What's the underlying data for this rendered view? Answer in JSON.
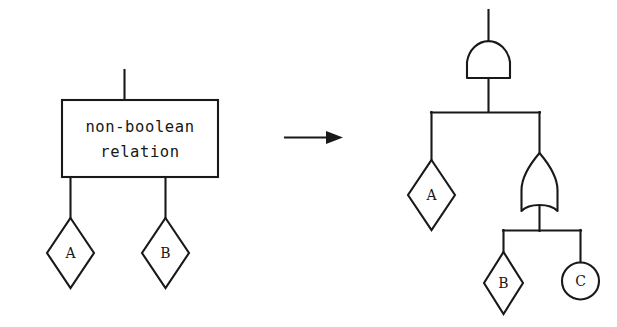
{
  "figure": {
    "kind": "logic-gate-transformation",
    "background_color": "#ffffff",
    "line_color": "#191919"
  },
  "left_side": {
    "block": {
      "line1": "non-boolean",
      "line2": "relation"
    },
    "top_wire": true,
    "children": [
      {
        "id": "A",
        "label": "A",
        "shape": "diamond"
      },
      {
        "id": "B",
        "label": "B",
        "shape": "diamond"
      }
    ]
  },
  "transform_arrow": {
    "symbol": "→",
    "direction": "right"
  },
  "right_side": {
    "root_gate": {
      "id": "and-gate",
      "type": "AND",
      "label": ""
    },
    "sub_gate": {
      "id": "or-gate",
      "type": "OR",
      "label": ""
    },
    "children": [
      {
        "id": "A",
        "label": "A",
        "shape": "diamond"
      },
      {
        "id": "B",
        "label": "B",
        "shape": "diamond"
      },
      {
        "id": "C",
        "label": "C",
        "shape": "circle"
      }
    ]
  }
}
